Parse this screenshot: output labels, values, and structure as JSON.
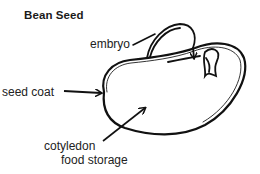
{
  "diagram": {
    "title": "Bean Seed",
    "labels": {
      "embryo": "embryo",
      "seed_coat": "seed coat",
      "cotyledon": "cotyledon",
      "food_storage": "food storage"
    },
    "colors": {
      "line": "#111111",
      "background": "#ffffff"
    }
  }
}
